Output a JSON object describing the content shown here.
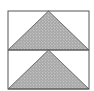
{
  "diagram": {
    "type": "geometric-figure",
    "outer_box": {
      "x": 8,
      "y": 11,
      "width": 81,
      "height": 78
    },
    "divider_y": 50,
    "panels": [
      {
        "id": "top",
        "y_top": 11,
        "y_bottom": 50,
        "triangle": {
          "apex_x": 48.5,
          "apex_y": 11,
          "base_left_x": 8,
          "base_right_x": 89,
          "base_y": 50
        }
      },
      {
        "id": "bottom",
        "y_top": 50,
        "y_bottom": 89,
        "triangle": {
          "apex_x": 48.5,
          "apex_y": 50,
          "base_left_x": 8,
          "base_right_x": 89,
          "base_y": 89
        }
      }
    ],
    "colors": {
      "stroke": "#555555",
      "fill": "#a8a8a8",
      "stipple": "#e6e6e6",
      "background": "#ffffff"
    }
  }
}
